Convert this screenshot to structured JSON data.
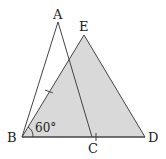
{
  "diagram": {
    "type": "geometry",
    "points": {
      "A": {
        "label": "A",
        "x": 58,
        "y": 22
      },
      "E": {
        "label": "E",
        "x": 84,
        "y": 35
      },
      "B": {
        "label": "B",
        "x": 22,
        "y": 137
      },
      "C": {
        "label": "C",
        "x": 92,
        "y": 137
      },
      "D": {
        "label": "D",
        "x": 145,
        "y": 137
      }
    },
    "angle_label": "60°",
    "colors": {
      "shade": "#d9d9d9",
      "line": "#444444"
    }
  }
}
